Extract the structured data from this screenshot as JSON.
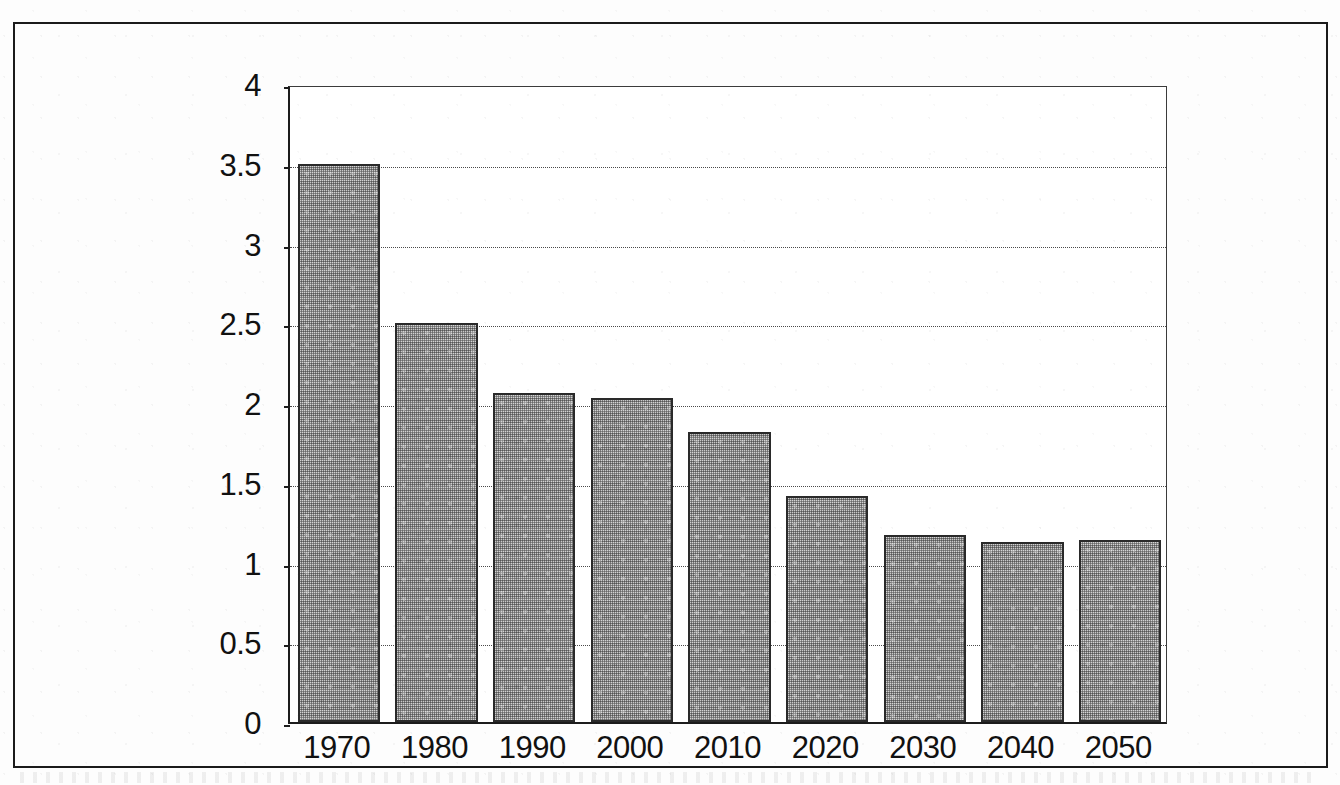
{
  "document": {
    "kind": "scanned-figure",
    "has_outer_frame": true
  },
  "chart_data": {
    "type": "bar",
    "title": "",
    "subtitle": "",
    "xlabel": "",
    "ylabel": "",
    "categories": [
      "1970",
      "1980",
      "1990",
      "2000",
      "2010",
      "2020",
      "2030",
      "2040",
      "2050"
    ],
    "values": [
      3.5,
      2.5,
      2.06,
      2.03,
      1.82,
      1.42,
      1.17,
      1.13,
      1.14
    ],
    "series": [
      {
        "name": "",
        "values": [
          3.5,
          2.5,
          2.06,
          2.03,
          1.82,
          1.42,
          1.17,
          1.13,
          1.14
        ]
      }
    ],
    "ylim": [
      0,
      4
    ],
    "yticks": [
      0,
      0.5,
      1,
      1.5,
      2,
      2.5,
      3,
      3.5,
      4
    ],
    "ytick_labels": [
      "0",
      "0.5",
      "1",
      "1.5",
      "2",
      "2.5",
      "3",
      "3.5",
      "4"
    ],
    "xtick_labels": [
      "1970",
      "1980",
      "1990",
      "2000",
      "2010",
      "2020",
      "2030",
      "2040",
      "2050"
    ],
    "grid": "horizontal-dotted",
    "legend": "none",
    "bar_fill": "#cfcfcf",
    "bar_border": "#2a2a2a",
    "axis_color": "#1c1c1c",
    "gridline_color": "#4a4a4a",
    "background": "#ffffff"
  }
}
